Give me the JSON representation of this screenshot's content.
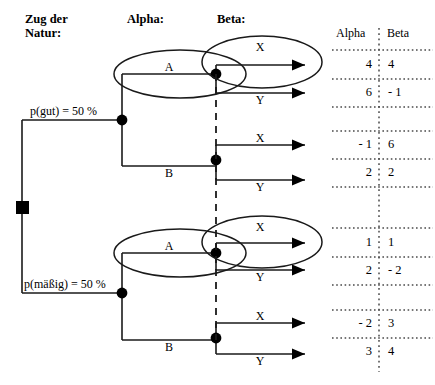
{
  "headers": {
    "nature": "Zug der\nNatur:",
    "alpha": "Alpha:",
    "beta": "Beta:"
  },
  "payoff_table": {
    "col_alpha": "Alpha",
    "col_beta": "Beta",
    "rows": [
      {
        "alpha": "4",
        "beta": "4"
      },
      {
        "alpha": "6",
        "beta": "- 1"
      },
      {
        "alpha": "- 1",
        "beta": "6"
      },
      {
        "alpha": "2",
        "beta": "2"
      },
      {
        "alpha": "1",
        "beta": "1"
      },
      {
        "alpha": "2",
        "beta": "- 2"
      },
      {
        "alpha": "- 2",
        "beta": "3"
      },
      {
        "alpha": "3",
        "beta": "4"
      }
    ]
  },
  "chance": {
    "good": "p(gut) = 50 %",
    "moderate": "p(mäßig) = 50 %"
  },
  "alpha_branches": {
    "a": "A",
    "b": "B"
  },
  "beta_branches": {
    "x": "X",
    "y": "Y"
  },
  "colors": {
    "line": "#1a1a1a",
    "node": "#000000",
    "background": "#ffffff"
  }
}
